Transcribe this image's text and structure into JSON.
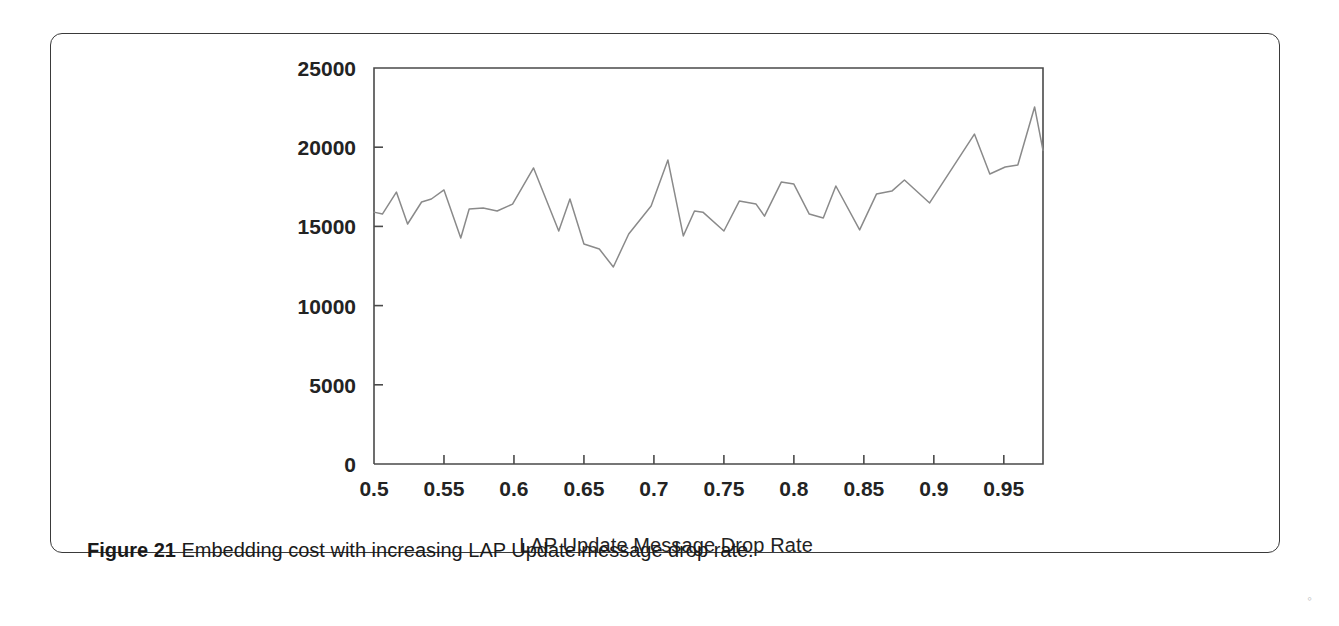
{
  "figure": {
    "caption_label": "Figure 21",
    "caption_text": "Embedding cost with increasing LAP Update message drop rate.",
    "speck_mark": "⸰"
  },
  "chart_data": {
    "type": "line",
    "title": "",
    "xlabel": "LAP Update Message Drop Rate",
    "ylabel": "",
    "xlim": [
      0.5,
      0.978
    ],
    "ylim": [
      0,
      25000
    ],
    "grid": false,
    "legend": "none",
    "line_color": "#8a8a8a",
    "axis_color": "#4a4a4a",
    "xticks": [
      0.5,
      0.55,
      0.6,
      0.65,
      0.7,
      0.75,
      0.8,
      0.85,
      0.9,
      0.95
    ],
    "xtick_labels": [
      "0.5",
      "0.55",
      "0.6",
      "0.65",
      "0.7",
      "0.75",
      "0.8",
      "0.85",
      "0.9",
      "0.95"
    ],
    "yticks": [
      0,
      5000,
      10000,
      15000,
      20000,
      25000
    ],
    "ytick_labels": [
      "0",
      "5000",
      "10000",
      "15000",
      "20000",
      "25000"
    ],
    "x": [
      0.5,
      0.506,
      0.516,
      0.524,
      0.534,
      0.541,
      0.55,
      0.562,
      0.568,
      0.578,
      0.588,
      0.599,
      0.614,
      0.632,
      0.64,
      0.65,
      0.661,
      0.671,
      0.682,
      0.698,
      0.71,
      0.721,
      0.729,
      0.735,
      0.75,
      0.761,
      0.773,
      0.779,
      0.791,
      0.8,
      0.811,
      0.821,
      0.83,
      0.847,
      0.859,
      0.87,
      0.879,
      0.897,
      0.929,
      0.94,
      0.951,
      0.96,
      0.972,
      0.978
    ],
    "y": [
      15900,
      15780,
      17170,
      15150,
      16540,
      16730,
      17300,
      14270,
      16100,
      16160,
      15970,
      16410,
      18690,
      14710,
      16730,
      13890,
      13570,
      12440,
      14520,
      16290,
      19190,
      14400,
      15970,
      15900,
      14710,
      16600,
      16410,
      15650,
      17800,
      17670,
      15780,
      15530,
      17550,
      14780,
      17040,
      17230,
      17930,
      16480,
      20830,
      18310,
      18750,
      18880,
      22540,
      19800
    ]
  }
}
